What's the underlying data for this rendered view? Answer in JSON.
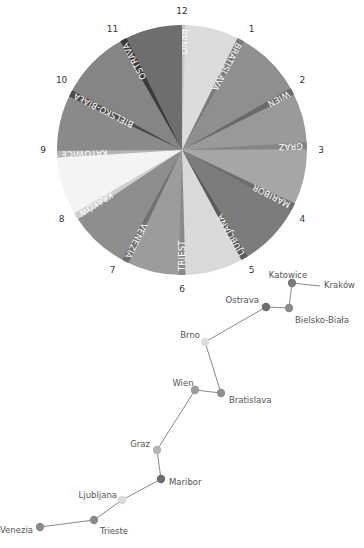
{
  "clock": {
    "hours": [
      "12",
      "1",
      "2",
      "3",
      "4",
      "5",
      "6",
      "7",
      "8",
      "9",
      "10",
      "11"
    ],
    "wedges": [
      {
        "label": "BRNO",
        "start": 0,
        "end": 28,
        "color": "#dcdcdc",
        "strip": "#c8c8c8"
      },
      {
        "label": "BRATISLAVA",
        "start": 28,
        "end": 62,
        "color": "#8f8f8f",
        "strip": "#7a7a7a"
      },
      {
        "label": "WIEN",
        "start": 62,
        "end": 88,
        "color": "#9a9a9a",
        "strip": "#6a6a6a"
      },
      {
        "label": "GRAZ",
        "start": 88,
        "end": 117,
        "color": "#a6a6a6",
        "strip": "#858585"
      },
      {
        "label": "MARIBOR",
        "start": 117,
        "end": 150,
        "color": "#7c7c7c",
        "strip": "#6e6e6e"
      },
      {
        "label": "LJUBLJANA",
        "start": 150,
        "end": 180,
        "color": "#d9d9d9",
        "strip": "#5a5a5a"
      },
      {
        "label": "TRIEST",
        "start": 180,
        "end": 207,
        "color": "#9c9c9c",
        "strip": "#8a8a8a"
      },
      {
        "label": "VENEZIA",
        "start": 207,
        "end": 238,
        "color": "#8e8e8e",
        "strip": "#707070"
      },
      {
        "label": "KRAKÓW",
        "start": 238,
        "end": 268,
        "color": "#f4f4f4",
        "strip": "#d0d0d0"
      },
      {
        "label": "KATOWICE",
        "start": 268,
        "end": 297,
        "color": "#8a8a8a",
        "strip": "#b5b5b5"
      },
      {
        "label": "BIELSKO-BIAŁA",
        "start": 297,
        "end": 332,
        "color": "#858585",
        "strip": "#4a4a4a"
      },
      {
        "label": "OSTRAVA",
        "start": 332,
        "end": 360,
        "color": "#6e6e6e",
        "strip": "#3a3a3a"
      }
    ]
  },
  "route": {
    "stops": [
      {
        "name": "Kraków",
        "x": 320,
        "y": 286,
        "dot": false,
        "lx": 324,
        "ly": 285,
        "anchor": "start"
      },
      {
        "name": "Katowice",
        "x": 292,
        "y": 283,
        "dot": true,
        "color": "#7a7a7a",
        "lx": 288,
        "ly": 275,
        "anchor": "middle"
      },
      {
        "name": "Bielsko-Biała",
        "x": 289,
        "y": 308,
        "dot": true,
        "color": "#8c8c8c",
        "lx": 295,
        "ly": 320,
        "anchor": "start"
      },
      {
        "name": "Ostrava",
        "x": 266,
        "y": 307,
        "dot": true,
        "color": "#6e6e6e",
        "lx": 259,
        "ly": 300,
        "anchor": "end"
      },
      {
        "name": "Brno",
        "x": 205,
        "y": 342,
        "dot": true,
        "color": "#dcdcdc",
        "lx": 200,
        "ly": 335,
        "anchor": "end"
      },
      {
        "name": "Bratislava",
        "x": 221,
        "y": 393,
        "dot": true,
        "color": "#8f8f8f",
        "lx": 229,
        "ly": 400,
        "anchor": "start"
      },
      {
        "name": "Wien",
        "x": 195,
        "y": 390,
        "dot": true,
        "color": "#9a9a9a",
        "lx": 183,
        "ly": 383,
        "anchor": "middle"
      },
      {
        "name": "Graz",
        "x": 157,
        "y": 450,
        "dot": true,
        "color": "#b5b5b5",
        "lx": 150,
        "ly": 444,
        "anchor": "end"
      },
      {
        "name": "Maribor",
        "x": 161,
        "y": 479,
        "dot": true,
        "color": "#6e6e6e",
        "lx": 169,
        "ly": 482,
        "anchor": "start"
      },
      {
        "name": "Ljubljana",
        "x": 122,
        "y": 500,
        "dot": true,
        "color": "#d9d9d9",
        "lx": 117,
        "ly": 495,
        "anchor": "end"
      },
      {
        "name": "Trieste",
        "x": 94,
        "y": 520,
        "dot": true,
        "color": "#8a8a8a",
        "lx": 100,
        "ly": 531,
        "anchor": "start"
      },
      {
        "name": "Venezia",
        "x": 40,
        "y": 527,
        "dot": true,
        "color": "#8a8a8a",
        "lx": 33,
        "ly": 530,
        "anchor": "end"
      }
    ]
  }
}
